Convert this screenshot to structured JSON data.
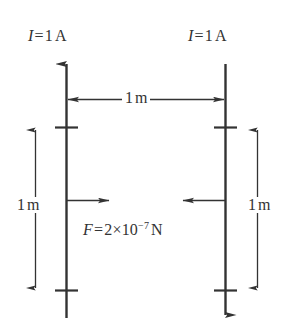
{
  "figure": {
    "background_color": "#ffffff",
    "stroke_color": "#333333"
  },
  "labels": {
    "left_current": {
      "symbol": "I",
      "equals": "=",
      "value": "1",
      "unit": "A",
      "full_text": "I = 1 A"
    },
    "right_current": {
      "symbol": "I",
      "equals": "=",
      "value": "1",
      "unit": "A",
      "full_text": "I = 1 A"
    },
    "separation": {
      "value": "1",
      "unit": "m",
      "full_text": "1 m"
    },
    "left_length": {
      "value": "1",
      "unit": "m",
      "full_text": "1 m"
    },
    "right_length": {
      "value": "1",
      "unit": "m",
      "full_text": "1 m"
    },
    "force": {
      "symbol": "F",
      "equals": "=",
      "mantissa": "2",
      "times": "×",
      "base": "10",
      "exponent": "−7",
      "unit": "N",
      "full_text": "F = 2×10−7 N"
    }
  },
  "elements": {
    "left_wire": {
      "name": "left-wire",
      "direction": "up",
      "arrowhead": "top"
    },
    "right_wire": {
      "name": "right-wire",
      "direction": "down",
      "arrowhead": "bottom"
    },
    "separation_arrow": {
      "name": "separation-dimension-arrow",
      "style": "double-headed",
      "orientation": "horizontal"
    },
    "left_length_arrow": {
      "name": "left-length-dimension-arrow",
      "style": "double-headed",
      "orientation": "vertical"
    },
    "right_length_arrow": {
      "name": "right-length-dimension-arrow",
      "style": "double-headed",
      "orientation": "vertical"
    },
    "left_force_arrow": {
      "name": "left-force-arrow",
      "direction": "right"
    },
    "right_force_arrow": {
      "name": "right-force-arrow",
      "direction": "left"
    }
  }
}
